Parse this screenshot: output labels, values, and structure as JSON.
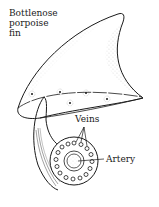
{
  "diagram": {
    "title_lines": [
      "Bottlenose",
      "porpoise",
      "fin"
    ],
    "labels": {
      "veins": "Veins",
      "artery": "Artery"
    },
    "colors": {
      "ink": "#1a1a1a",
      "background": "#ffffff",
      "stipple": "#555555"
    },
    "parts": [
      "fin",
      "fin-base-cross-section",
      "blood-vessel-cross-section"
    ],
    "vein_count": 16
  }
}
